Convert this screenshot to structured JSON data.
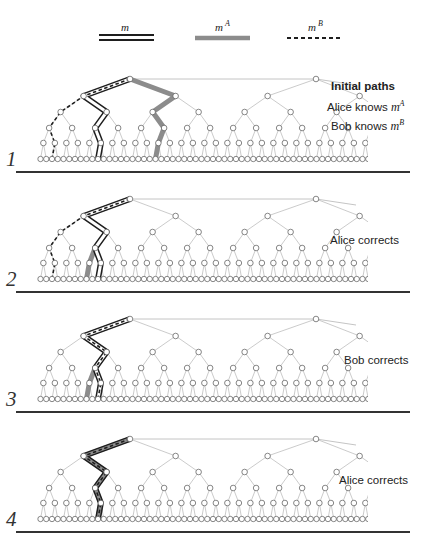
{
  "legend": {
    "items": [
      {
        "symbol": "m",
        "sup": "",
        "style": "double-line",
        "color": "#222222"
      },
      {
        "symbol": "m",
        "sup": "A",
        "style": "thick-gray",
        "color": "#8c8c8c"
      },
      {
        "symbol": "m",
        "sup": "B",
        "style": "dashed",
        "color": "#222222"
      }
    ]
  },
  "panels": [
    {
      "number": "1",
      "captions": [
        {
          "text": "Initial paths",
          "bold": true
        },
        {
          "text": "Alice knows ",
          "math": "m",
          "sup": "A",
          "bold": false
        },
        {
          "text": "Bob knows ",
          "math": "m",
          "sup": "B",
          "bold": false
        }
      ],
      "paths": {
        "m": [
          [
            0,
            0
          ],
          [
            1,
            0
          ],
          [
            2,
            1
          ],
          [
            3,
            2
          ],
          [
            4,
            5
          ],
          [
            5,
            10
          ]
        ],
        "mA": [
          [
            0,
            0
          ],
          [
            1,
            1
          ],
          [
            2,
            2
          ],
          [
            3,
            5
          ],
          [
            4,
            10
          ],
          [
            5,
            20
          ]
        ],
        "mB": [
          [
            0,
            0
          ],
          [
            1,
            0
          ],
          [
            2,
            0
          ],
          [
            3,
            0
          ],
          [
            4,
            1
          ],
          [
            5,
            2
          ]
        ]
      }
    },
    {
      "number": "2",
      "captions": [
        {
          "text": "Alice corrects",
          "bold": false
        }
      ],
      "paths": {
        "m": [
          [
            0,
            0
          ],
          [
            1,
            0
          ],
          [
            2,
            1
          ],
          [
            3,
            2
          ],
          [
            4,
            5
          ],
          [
            5,
            10
          ]
        ],
        "mA": [
          [
            0,
            0
          ],
          [
            1,
            0
          ],
          [
            2,
            1
          ],
          [
            3,
            2
          ],
          [
            4,
            4
          ],
          [
            5,
            8
          ]
        ],
        "mB": [
          [
            0,
            0
          ],
          [
            1,
            0
          ],
          [
            2,
            0
          ],
          [
            3,
            0
          ],
          [
            4,
            1
          ],
          [
            5,
            2
          ]
        ]
      }
    },
    {
      "number": "3",
      "captions": [
        {
          "text": "Bob corrects",
          "bold": false
        }
      ],
      "paths": {
        "m": [
          [
            0,
            0
          ],
          [
            1,
            0
          ],
          [
            2,
            1
          ],
          [
            3,
            2
          ],
          [
            4,
            5
          ],
          [
            5,
            10
          ]
        ],
        "mA": [
          [
            0,
            0
          ],
          [
            1,
            0
          ],
          [
            2,
            1
          ],
          [
            3,
            2
          ],
          [
            4,
            4
          ],
          [
            5,
            8
          ]
        ],
        "mB": [
          [
            0,
            0
          ],
          [
            1,
            0
          ],
          [
            2,
            1
          ],
          [
            3,
            2
          ],
          [
            4,
            5
          ],
          [
            5,
            10
          ]
        ]
      }
    },
    {
      "number": "4",
      "captions": [
        {
          "text": "Alice corrects",
          "bold": false
        }
      ],
      "paths": {
        "m": [
          [
            0,
            0
          ],
          [
            1,
            0
          ],
          [
            2,
            1
          ],
          [
            3,
            2
          ],
          [
            4,
            5
          ],
          [
            5,
            10
          ]
        ],
        "mA": [
          [
            0,
            0
          ],
          [
            1,
            0
          ],
          [
            2,
            1
          ],
          [
            3,
            2
          ],
          [
            4,
            5
          ],
          [
            5,
            10
          ]
        ],
        "mB": [
          [
            0,
            0
          ],
          [
            1,
            0
          ],
          [
            2,
            1
          ],
          [
            3,
            2
          ],
          [
            4,
            5
          ],
          [
            5,
            10
          ]
        ]
      }
    }
  ],
  "colors": {
    "tree_edge": "#b5b5b5",
    "node_stroke": "#555555",
    "path_m": "#1e1e1e",
    "path_mA": "#8c8c8c",
    "path_mB": "#1e1e1e",
    "separator": "#333333"
  }
}
